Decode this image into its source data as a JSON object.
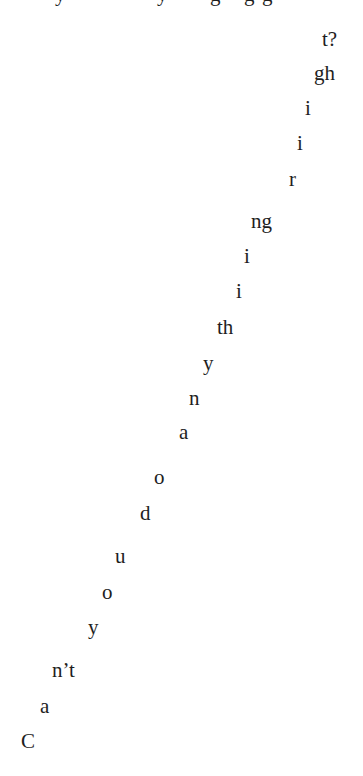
{
  "top_clipped_line": {
    "fragments": [
      "y",
      "y",
      "g",
      "g",
      "g"
    ]
  },
  "staircase_text": {
    "full_sentence": "Can't you do anything right?",
    "fragments": [
      {
        "text": "C"
      },
      {
        "text": "a"
      },
      {
        "text": "n’t"
      },
      {
        "text": "y"
      },
      {
        "text": "o"
      },
      {
        "text": "u"
      },
      {
        "text": "d"
      },
      {
        "text": "o"
      },
      {
        "text": "a"
      },
      {
        "text": "n"
      },
      {
        "text": "y"
      },
      {
        "text": "th"
      },
      {
        "text": "i"
      },
      {
        "text": "i"
      },
      {
        "text": "ng"
      },
      {
        "text": "r"
      },
      {
        "text": "i"
      },
      {
        "text": "i"
      },
      {
        "text": "gh"
      },
      {
        "text": "t?"
      }
    ]
  },
  "colors": {
    "text": "#1e1e1e",
    "background": "#ffffff"
  }
}
